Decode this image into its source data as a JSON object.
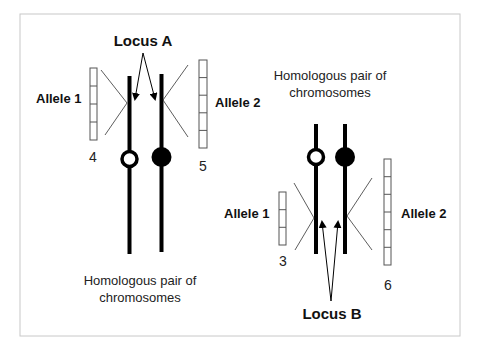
{
  "diagram": {
    "frame": {
      "x": 20,
      "y": 14,
      "w": 440,
      "h": 322,
      "stroke": "#c8c8c8"
    },
    "colors": {
      "chromosome": "#000000",
      "thin_line": "#333333",
      "box_stroke": "#555555"
    },
    "top_pair": {
      "locus_label": "Locus A",
      "caption_line1": "Homologous pair of",
      "caption_line2": "chromosomes",
      "left_allele": {
        "label": "Allele 1",
        "number": "4",
        "cells": 4
      },
      "right_allele": {
        "label": "Allele 2",
        "number": "5",
        "cells": 5
      },
      "left_centromere": "open",
      "right_centromere": "filled"
    },
    "bottom_pair": {
      "locus_label": "Locus B",
      "caption_line1": "Homologous pair of",
      "caption_line2": "chromosomes",
      "left_allele": {
        "label": "Allele 1",
        "number": "3",
        "cells": 3
      },
      "right_allele": {
        "label": "Allele 2",
        "number": "6",
        "cells": 6
      },
      "left_centromere": "open",
      "right_centromere": "filled"
    }
  }
}
